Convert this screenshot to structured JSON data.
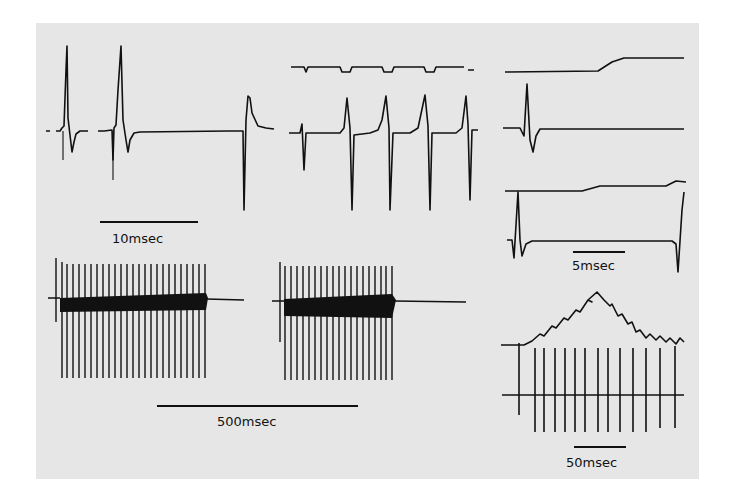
{
  "figure": {
    "background": "#e6e6e6",
    "ink": "#111111",
    "panels": [
      {
        "id": "top-left",
        "description": "Two action potentials followed by an inverted spike",
        "scale_label": "10msec"
      },
      {
        "id": "top-middle",
        "description": "Stimulus trace with rhythmic spikes"
      },
      {
        "id": "right-upper",
        "description": "Two-trace recordings",
        "scale_label": "5msec"
      },
      {
        "id": "bottom-left",
        "description": "Two bursts of high-frequency firing",
        "scale_label": "500msec"
      },
      {
        "id": "right-lower",
        "description": "Summating potential with spike train",
        "scale_label": "50msec"
      }
    ]
  },
  "labels": {
    "scale_10": "10msec",
    "scale_5": "5msec",
    "scale_500": "500msec",
    "scale_50": "50msec"
  }
}
